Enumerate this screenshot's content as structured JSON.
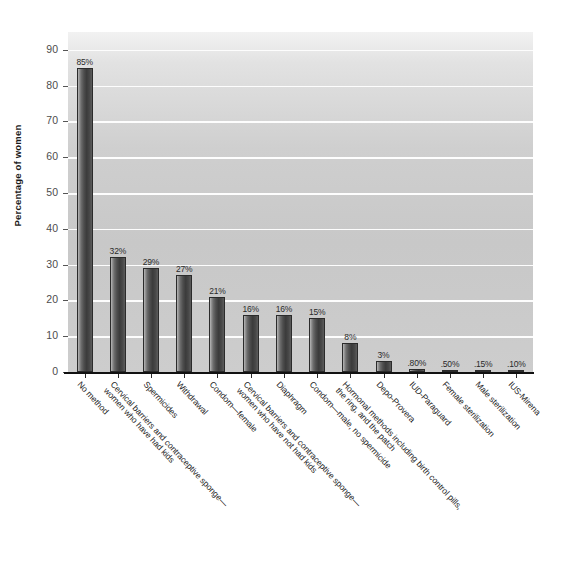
{
  "chart_data": {
    "type": "bar",
    "title": "",
    "xlabel": "",
    "ylabel": "Percentage of women",
    "ylim": [
      0,
      95
    ],
    "yticks": [
      0,
      10,
      20,
      30,
      40,
      50,
      60,
      70,
      80,
      90
    ],
    "ytick_labels": [
      "0",
      "10",
      "20",
      "30",
      "40",
      "50",
      "60",
      "70",
      "80",
      "90"
    ],
    "grid": true,
    "legend": "none",
    "categories": [
      "No method",
      "Cervical barriers and contraceptive sponge—women who have had kids",
      "Spermicides",
      "Withdrawal",
      "Condom—female",
      "Cervical barriers and contraceptive sponge—women who have not had kids",
      "Diaphragm",
      "Condom—male, no spermicide",
      "Hormonal methods including birth control pills, the ring, and the patch",
      "Depo-Provera",
      "IUD-Paraguard",
      "Female sterilization",
      "Male sterilization",
      "IUS-Mirena"
    ],
    "category_lines": [
      [
        "No method",
        ""
      ],
      [
        "Cervical barriers and contraceptive sponge—",
        "women who have had kids"
      ],
      [
        "Spermicides",
        ""
      ],
      [
        "Withdrawal",
        ""
      ],
      [
        "Condom—female",
        ""
      ],
      [
        "Cervical barriers and contraceptive sponge—",
        "women who have not had kids"
      ],
      [
        "Diaphragm",
        ""
      ],
      [
        "Condom—male, no spermicide",
        ""
      ],
      [
        "Hormonal methods including birth control pills,",
        "the ring, and the patch"
      ],
      [
        "Depo-Provera",
        ""
      ],
      [
        "IUD-Paraguard",
        ""
      ],
      [
        "Female sterilization",
        ""
      ],
      [
        "Male sterilization",
        ""
      ],
      [
        "IUS-Mirena",
        ""
      ]
    ],
    "values": [
      85,
      32,
      29,
      27,
      21,
      16,
      16,
      15,
      8,
      3,
      0.8,
      0.5,
      0.15,
      0.1
    ],
    "data_labels": [
      "85%",
      "32%",
      "29%",
      "27%",
      "21%",
      "16%",
      "16%",
      "15%",
      "8%",
      "3%",
      ".80%",
      ".50%",
      ".15%",
      ".10%"
    ]
  },
  "colors": {
    "plot_background_top": "#f2f2f2",
    "plot_background_bottom": "#cdcdcd",
    "gridline": "#fdfdfd",
    "bar_dark": "#3b3b3b",
    "bar_light": "#b9b9b9",
    "axis": "#111111",
    "text": "#232323"
  }
}
